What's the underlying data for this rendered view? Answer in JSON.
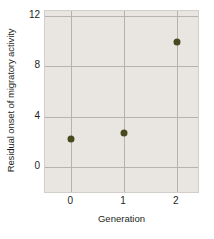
{
  "chart_data": {
    "type": "scatter",
    "title": "",
    "xlabel": "Generation",
    "ylabel": "Residual onset of migratory activity",
    "x": [
      0,
      1,
      2
    ],
    "values": [
      2.2,
      2.7,
      9.9
    ],
    "points": [
      {
        "x": 0,
        "y": 2.2
      },
      {
        "x": 1,
        "y": 2.7
      },
      {
        "x": 2,
        "y": 9.9
      }
    ],
    "xlim": [
      -0.5,
      2.4
    ],
    "ylim": [
      -2.0,
      12.4
    ],
    "xticks": [
      0,
      1,
      2
    ],
    "xtick_labels": [
      "0",
      "1",
      "2"
    ],
    "yticks": [
      0,
      4,
      8,
      12
    ],
    "ytick_labels": [
      "0",
      "4",
      "8",
      "12"
    ],
    "grid": true,
    "legend": null,
    "marker_color": "#49481f",
    "plot_background": "#e9e6e2",
    "grid_color": "#b6b3ae",
    "text_color": "#231f20"
  }
}
